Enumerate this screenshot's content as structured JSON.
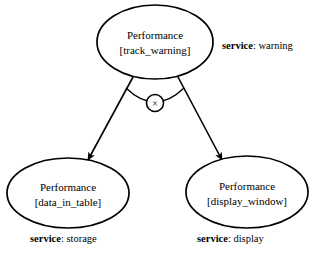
{
  "diagram": {
    "type": "entity-relationship-diagram",
    "background_color": "#ffffff",
    "stroke_color": "#000000",
    "nodes": [
      {
        "id": "track-warning",
        "title": "Performance",
        "instance": "[track_warning]",
        "service_key": "service",
        "service_separator": ": ",
        "service_value": "warning",
        "shape": "ellipse",
        "cx": 155,
        "cy": 42,
        "rx": 58,
        "ry": 37
      },
      {
        "id": "data-in-table",
        "title": "Performance",
        "instance": "[data_in_table]",
        "service_key": "service",
        "service_separator": ": ",
        "service_value": "storage",
        "shape": "ellipse",
        "cx": 68,
        "cy": 193,
        "rx": 61,
        "ry": 35
      },
      {
        "id": "display-window",
        "title": "Performance",
        "instance": "[display_window]",
        "service_key": "service",
        "service_separator": ": ",
        "service_value": "display",
        "shape": "ellipse",
        "cx": 247,
        "cy": 192,
        "rx": 61,
        "ry": 36
      }
    ],
    "connector": {
      "symbol_label": "×",
      "symbol_name": "xor-exclusive-constraint",
      "symbol_cx": 155,
      "symbol_cy": 103,
      "symbol_r": 8.5
    },
    "edges": [
      {
        "id": "edge-to-storage",
        "from": "track-warning",
        "to": "data-in-table",
        "arrowhead": "solid-filled-triangle"
      },
      {
        "id": "edge-to-display",
        "from": "track-warning",
        "to": "display-window",
        "arrowhead": "solid-filled-triangle"
      }
    ],
    "page_caption_fragment": ""
  }
}
